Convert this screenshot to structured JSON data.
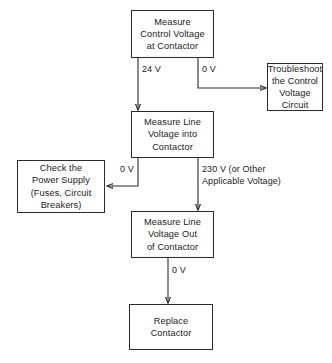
{
  "diagram": {
    "type": "flowchart",
    "colors": {
      "line": "#2b2b2b",
      "text": "#1a1a1a",
      "background": "#ffffff"
    },
    "nodes": [
      {
        "id": "measure-control-voltage",
        "text": "Measure\nControl Voltage\nat Contactor"
      },
      {
        "id": "troubleshoot-control-circuit",
        "text": "Troubleshoot\nthe Control\nVoltage Circuit"
      },
      {
        "id": "measure-line-voltage-into",
        "text": "Measure Line\nVoltage into\nContactor"
      },
      {
        "id": "check-power-supply",
        "text": "Check the\nPower Supply\n(Fuses, Circuit\nBreakers)"
      },
      {
        "id": "measure-line-voltage-out",
        "text": "Measure Line\nVoltage Out\nof Contactor"
      },
      {
        "id": "replace-contactor",
        "text": "Replace\nContactor"
      }
    ],
    "edges": [
      {
        "id": "control-to-line-in",
        "label": "24 V",
        "from": "measure-control-voltage",
        "to": "measure-line-voltage-into"
      },
      {
        "id": "control-to-troubleshoot",
        "label": "0 V",
        "from": "measure-control-voltage",
        "to": "troubleshoot-control-circuit"
      },
      {
        "id": "line-in-to-power-supply",
        "label": "0 V",
        "from": "measure-line-voltage-into",
        "to": "check-power-supply"
      },
      {
        "id": "line-in-to-line-out",
        "label": "230 V (or Other\nApplicable Voltage)",
        "from": "measure-line-voltage-into",
        "to": "measure-line-voltage-out"
      },
      {
        "id": "line-out-to-replace",
        "label": "0 V",
        "from": "measure-line-voltage-out",
        "to": "replace-contactor"
      }
    ]
  }
}
